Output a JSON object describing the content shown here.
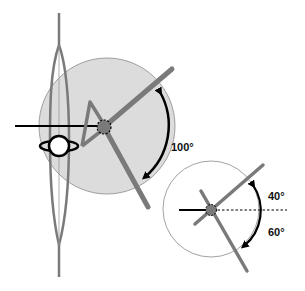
{
  "diagram": {
    "colors": {
      "limb": "#7a7a7a",
      "large_circle_fill": "#dcdcdc",
      "circle_stroke": "#8a8a8a",
      "arrow": "#000000",
      "background": "#ffffff"
    },
    "main_figure": {
      "angle_label": "100°"
    },
    "inset_figure": {
      "upper_angle_label": "40°",
      "lower_angle_label": "60°"
    }
  }
}
